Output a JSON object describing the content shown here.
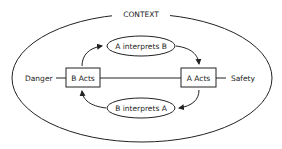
{
  "diagram": {
    "context_label": "CONTEXT",
    "left_label": "Danger",
    "right_label": "Safety",
    "nodes": {
      "b_acts": "B Acts",
      "a_acts": "A Acts",
      "a_interprets_b": "A interprets B",
      "b_interprets_a": "B interprets A"
    },
    "colors": {
      "stroke": "#222222",
      "background": "#ffffff"
    }
  }
}
